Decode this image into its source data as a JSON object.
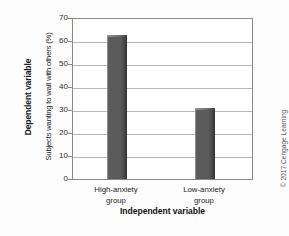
{
  "chart_data": {
    "type": "bar",
    "title": "",
    "categories": [
      "High-anxiety group",
      "Low-anxiety group"
    ],
    "values": [
      63,
      31
    ],
    "xlabel": "Independent variable",
    "ylabel": "Subjects wanting to wait with others (%)",
    "ylim": [
      0,
      70
    ],
    "yticks": [
      0,
      10,
      20,
      30,
      40,
      50,
      60,
      70
    ],
    "grid": true,
    "legend": "none",
    "bar_color": "#575757"
  },
  "axes": {
    "y_outer_title": "Dependent variable",
    "y_inner_title": "Subjects wanting to wait with others (%)",
    "x_title": "Independent variable",
    "y_tick_labels": [
      "70",
      "60",
      "50",
      "40",
      "30",
      "20",
      "10",
      "0"
    ],
    "x_tick_labels": [
      "High-anxiety\ngroup",
      "Low-anxiety\ngroup"
    ]
  },
  "footer": {
    "copyright": "© 2017 Cengage Learning"
  }
}
